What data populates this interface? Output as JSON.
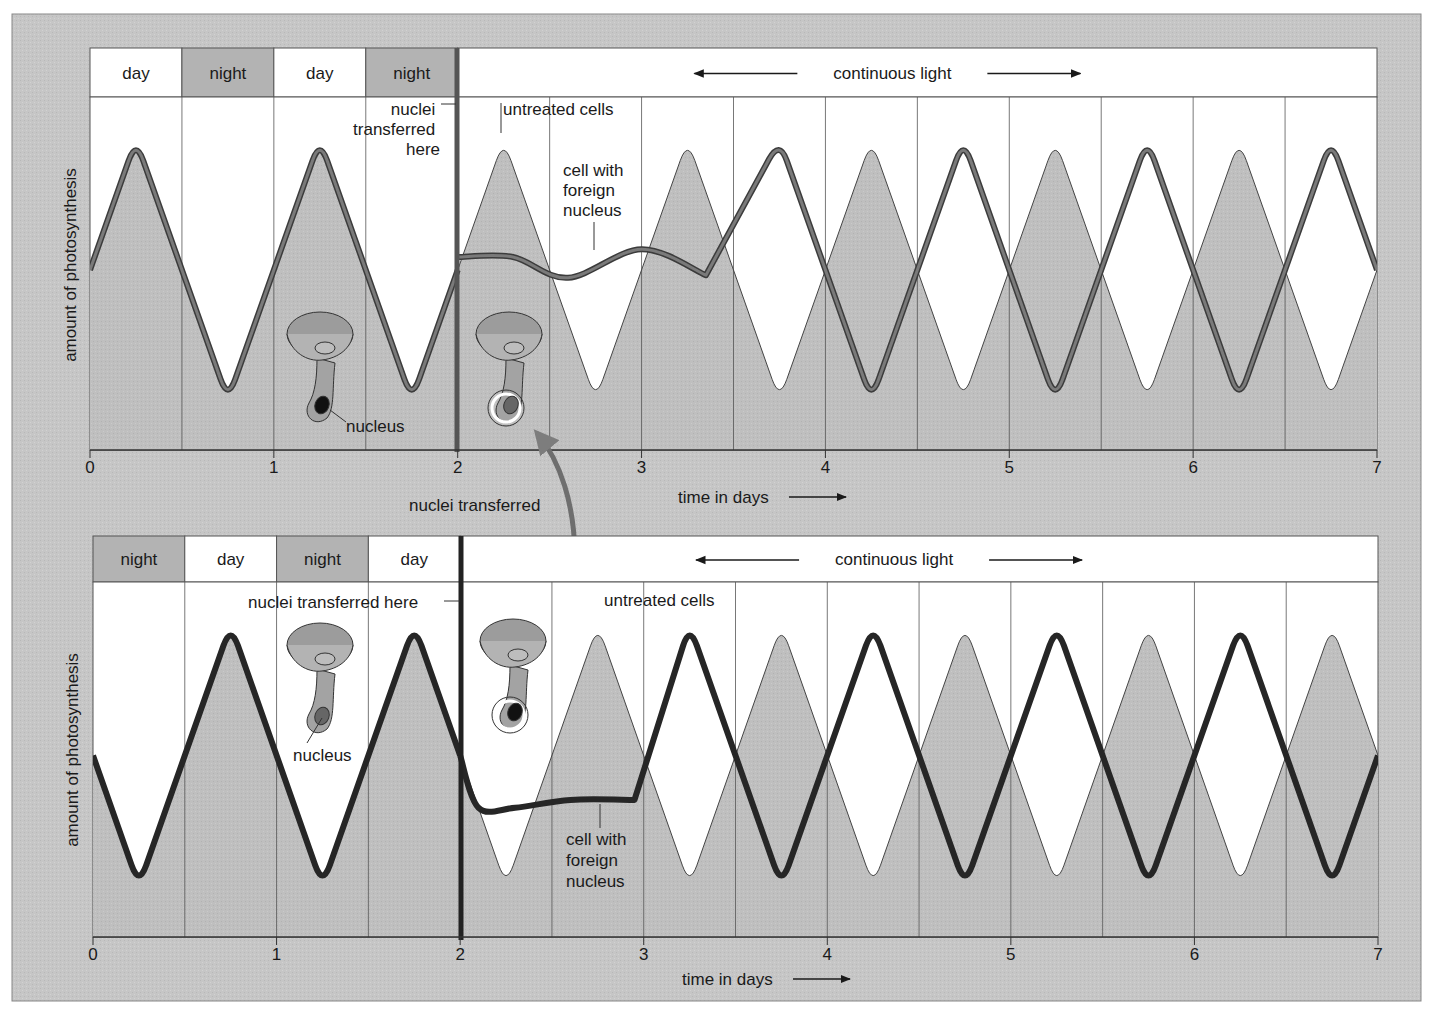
{
  "figure": {
    "top_panel": {
      "header_cells": [
        {
          "label": "day",
          "shade": "light"
        },
        {
          "label": "night",
          "shade": "dark"
        },
        {
          "label": "day",
          "shade": "light"
        },
        {
          "label": "night",
          "shade": "dark"
        }
      ],
      "continuous_label": "continuous light",
      "y_axis_label": "amount of photosynthesis",
      "x_axis_label": "time in days",
      "x_ticks": [
        "0",
        "1",
        "2",
        "3",
        "4",
        "5",
        "6",
        "7"
      ],
      "annotations": {
        "transfer_here": [
          "nuclei",
          "transferred",
          "here"
        ],
        "untreated": "untreated cells",
        "foreign": [
          "cell with",
          "foreign",
          "nucleus"
        ],
        "nucleus": "nucleus"
      }
    },
    "middle_label": "nuclei transferred",
    "bottom_panel": {
      "header_cells": [
        {
          "label": "night",
          "shade": "dark"
        },
        {
          "label": "day",
          "shade": "light"
        },
        {
          "label": "night",
          "shade": "dark"
        },
        {
          "label": "day",
          "shade": "light"
        }
      ],
      "continuous_label": "continuous light",
      "y_axis_label": "amount of photosynthesis",
      "x_axis_label": "time in days",
      "x_ticks": [
        "0",
        "1",
        "2",
        "3",
        "4",
        "5",
        "6",
        "7"
      ],
      "annotations": {
        "transfer_here": "nuclei transferred here",
        "untreated": "untreated cells",
        "foreign": [
          "cell with",
          "foreign",
          "nucleus"
        ],
        "nucleus": "nucleus"
      }
    },
    "colors": {
      "frame_bg": "#c9c9c9",
      "plot_fill": "#bdbdbd",
      "white": "#ffffff",
      "top_curve": "#6b6b6b",
      "bottom_curve": "#2a2a2a",
      "arrow": "#7d7d7d",
      "night_header": "#b5b5b5"
    }
  },
  "chart_data": [
    {
      "type": "line",
      "title": "Top panel: cells entrained to day/night, nucleus transferred at day 2",
      "xlabel": "time in days",
      "ylabel": "amount of photosynthesis",
      "xlim": [
        0,
        7
      ],
      "x_ticks": [
        0,
        1,
        2,
        3,
        4,
        5,
        6,
        7
      ],
      "light_schedule": [
        {
          "from": 0,
          "to": 0.5,
          "label": "day"
        },
        {
          "from": 0.5,
          "to": 1,
          "label": "night"
        },
        {
          "from": 1,
          "to": 1.5,
          "label": "day"
        },
        {
          "from": 1.5,
          "to": 2,
          "label": "night"
        },
        {
          "from": 2,
          "to": 7,
          "label": "continuous light"
        }
      ],
      "series": [
        {
          "name": "entrained cells (days 0-2)",
          "x": [
            0,
            0.25,
            0.75,
            1.25,
            1.75,
            2
          ],
          "y": [
            0.5,
            1,
            0,
            1,
            0,
            0.5
          ]
        },
        {
          "name": "untreated cells",
          "x": [
            2,
            2.25,
            2.75,
            3.25,
            3.75,
            4.25,
            4.75,
            5.25,
            5.75,
            6.25,
            6.75,
            7
          ],
          "y": [
            0.5,
            1,
            0,
            1,
            0,
            1,
            0,
            1,
            0,
            1,
            0,
            0.5
          ]
        },
        {
          "name": "cell with foreign nucleus",
          "x": [
            2,
            2.3,
            2.6,
            3.0,
            3.35,
            3.75,
            4.25,
            4.75,
            5.25,
            5.75,
            6.25,
            6.75,
            7
          ],
          "y": [
            0.55,
            0.55,
            0.47,
            0.58,
            0.48,
            1,
            0,
            1,
            0,
            1,
            0,
            1,
            0.5
          ]
        }
      ],
      "annotations": [
        "nuclei transferred here",
        "untreated cells",
        "cell with foreign nucleus",
        "nucleus"
      ]
    },
    {
      "type": "line",
      "title": "Bottom panel: cells entrained to opposite day/night, nucleus transferred at day 2",
      "xlabel": "time in days",
      "ylabel": "amount of photosynthesis",
      "xlim": [
        0,
        7
      ],
      "x_ticks": [
        0,
        1,
        2,
        3,
        4,
        5,
        6,
        7
      ],
      "light_schedule": [
        {
          "from": 0,
          "to": 0.5,
          "label": "night"
        },
        {
          "from": 0.5,
          "to": 1,
          "label": "day"
        },
        {
          "from": 1,
          "to": 1.5,
          "label": "night"
        },
        {
          "from": 1.5,
          "to": 2,
          "label": "day"
        },
        {
          "from": 2,
          "to": 7,
          "label": "continuous light"
        }
      ],
      "series": [
        {
          "name": "entrained cells (days 0-2)",
          "x": [
            0,
            0.25,
            0.75,
            1.25,
            1.75,
            2
          ],
          "y": [
            0.5,
            0,
            1,
            0,
            1,
            0.5
          ]
        },
        {
          "name": "untreated cells",
          "x": [
            2,
            2.25,
            2.75,
            3.25,
            3.75,
            4.25,
            4.75,
            5.25,
            5.75,
            6.25,
            6.75,
            7
          ],
          "y": [
            0.5,
            0,
            1,
            0,
            1,
            0,
            1,
            0,
            1,
            0,
            1,
            0.5
          ]
        },
        {
          "name": "cell with foreign nucleus",
          "x": [
            2,
            2.1,
            2.3,
            2.6,
            2.95,
            3.25,
            3.75,
            4.25,
            4.75,
            5.25,
            5.75,
            6.25,
            6.75,
            7
          ],
          "y": [
            0.5,
            0.3,
            0.3,
            0.33,
            0.33,
            1,
            0,
            1,
            0,
            1,
            0,
            1,
            0,
            0.5
          ]
        }
      ],
      "annotations": [
        "nuclei transferred here",
        "untreated cells",
        "cell with foreign nucleus",
        "nucleus"
      ]
    }
  ]
}
